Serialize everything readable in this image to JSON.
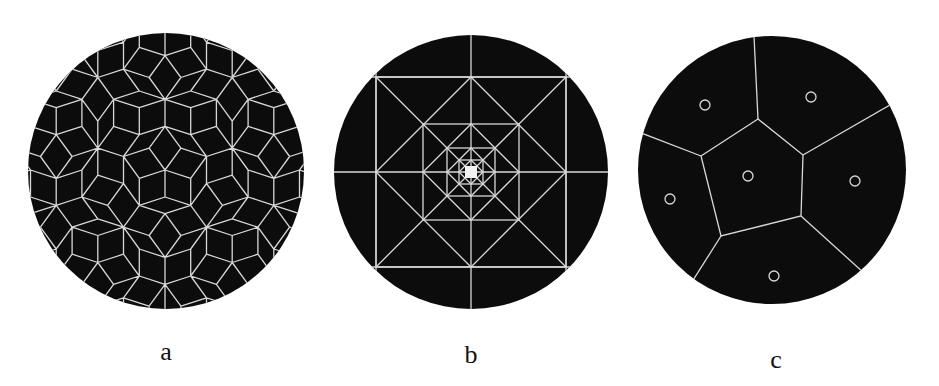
{
  "figure": {
    "background": "#ffffff",
    "disk_color": "#0c0c0c",
    "line_color": "#d8d8d8",
    "panels": [
      {
        "id": "a",
        "label": "a",
        "kind": "penrose-rhombus-tiling",
        "center": [
          166,
          171
        ],
        "radius": 138,
        "edge_length": 27,
        "central_vertex": [
          165,
          170
        ],
        "label_pos": [
          166,
          353
        ]
      },
      {
        "id": "b",
        "label": "b",
        "kind": "nested-square-subdivision",
        "center": [
          471,
          172
        ],
        "radius": 137,
        "square_half_widths": [
          95,
          48,
          24,
          12
        ],
        "center_square_half_width": 6,
        "center_square_color": "#f2f2f2",
        "label_pos": [
          471,
          356
        ]
      },
      {
        "id": "c",
        "label": "c",
        "kind": "voronoi-diagram",
        "center": [
          772,
          170
        ],
        "radius": 134,
        "central_cell": [
          [
            758,
            119
          ],
          [
            803,
            155
          ],
          [
            801,
            216
          ],
          [
            721,
            236
          ],
          [
            701,
            156
          ]
        ],
        "rays": [
          [
            [
              758,
              119
            ],
            [
              754,
              36
            ]
          ],
          [
            [
              803,
              155
            ],
            [
              883,
              109
            ]
          ],
          [
            [
              801,
              216
            ],
            [
              864,
              273
            ]
          ],
          [
            [
              721,
              236
            ],
            [
              690,
              285
            ]
          ],
          [
            [
              701,
              156
            ],
            [
              644,
              134
            ]
          ]
        ],
        "sites": [
          [
            705,
            105
          ],
          [
            811,
            97
          ],
          [
            748,
            176
          ],
          [
            855,
            181
          ],
          [
            670,
            199
          ],
          [
            774,
            276
          ]
        ],
        "site_radius": 5,
        "label_pos": [
          776,
          361
        ]
      }
    ]
  }
}
